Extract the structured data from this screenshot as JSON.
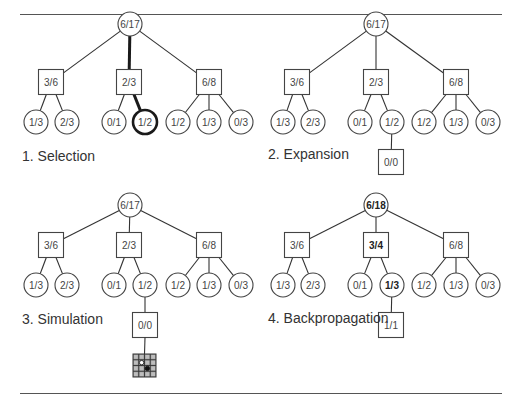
{
  "figure": {
    "colors": {
      "stroke": "#444444",
      "highlight": "#1a1a1a",
      "text": "#333333",
      "board_fill": "#999999",
      "board_grid": "#333333"
    },
    "panels": [
      {
        "id": "selection",
        "label": "1. Selection",
        "label_pos": [
          22,
          148
        ],
        "nodes": [
          {
            "id": "r",
            "shape": "circle",
            "x": 130,
            "y": 24,
            "text": "6/17"
          },
          {
            "id": "a",
            "shape": "square",
            "x": 51,
            "y": 82,
            "text": "3/6"
          },
          {
            "id": "b",
            "shape": "square",
            "x": 129,
            "y": 82,
            "text": "2/3"
          },
          {
            "id": "c",
            "shape": "square",
            "x": 209,
            "y": 82,
            "text": "6/8"
          },
          {
            "id": "a1",
            "shape": "circle",
            "x": 36,
            "y": 122,
            "text": "1/3"
          },
          {
            "id": "a2",
            "shape": "circle",
            "x": 67,
            "y": 122,
            "text": "2/3"
          },
          {
            "id": "b1",
            "shape": "circle",
            "x": 114,
            "y": 122,
            "text": "0/1"
          },
          {
            "id": "b2",
            "shape": "circle",
            "x": 145,
            "y": 122,
            "text": "1/2",
            "highlight": true
          },
          {
            "id": "c1",
            "shape": "circle",
            "x": 178,
            "y": 122,
            "text": "1/2"
          },
          {
            "id": "c2",
            "shape": "circle",
            "x": 209,
            "y": 122,
            "text": "1/3"
          },
          {
            "id": "c3",
            "shape": "circle",
            "x": 241,
            "y": 122,
            "text": "0/3"
          }
        ],
        "edges": [
          [
            "r",
            "a"
          ],
          [
            "r",
            "b",
            true
          ],
          [
            "r",
            "c"
          ],
          [
            "a",
            "a1"
          ],
          [
            "a",
            "a2"
          ],
          [
            "b",
            "b1"
          ],
          [
            "b",
            "b2",
            true
          ],
          [
            "c",
            "c1"
          ],
          [
            "c",
            "c2"
          ],
          [
            "c",
            "c3"
          ]
        ]
      },
      {
        "id": "expansion",
        "label": "2. Expansion",
        "label_pos": [
          268,
          146
        ],
        "nodes": [
          {
            "id": "r",
            "shape": "circle",
            "x": 376,
            "y": 24,
            "text": "6/17"
          },
          {
            "id": "a",
            "shape": "square",
            "x": 297,
            "y": 82,
            "text": "3/6"
          },
          {
            "id": "b",
            "shape": "square",
            "x": 376,
            "y": 82,
            "text": "2/3"
          },
          {
            "id": "c",
            "shape": "square",
            "x": 456,
            "y": 82,
            "text": "6/8"
          },
          {
            "id": "a1",
            "shape": "circle",
            "x": 283,
            "y": 122,
            "text": "1/3"
          },
          {
            "id": "a2",
            "shape": "circle",
            "x": 313,
            "y": 122,
            "text": "2/3"
          },
          {
            "id": "b1",
            "shape": "circle",
            "x": 360,
            "y": 122,
            "text": "0/1"
          },
          {
            "id": "b2",
            "shape": "circle",
            "x": 392,
            "y": 122,
            "text": "1/2"
          },
          {
            "id": "c1",
            "shape": "circle",
            "x": 424,
            "y": 122,
            "text": "1/2"
          },
          {
            "id": "c2",
            "shape": "circle",
            "x": 456,
            "y": 122,
            "text": "1/3"
          },
          {
            "id": "c3",
            "shape": "circle",
            "x": 488,
            "y": 122,
            "text": "0/3"
          },
          {
            "id": "n",
            "shape": "square",
            "x": 391,
            "y": 162,
            "text": "0/0"
          }
        ],
        "edges": [
          [
            "r",
            "a"
          ],
          [
            "r",
            "b"
          ],
          [
            "r",
            "c"
          ],
          [
            "a",
            "a1"
          ],
          [
            "a",
            "a2"
          ],
          [
            "b",
            "b1"
          ],
          [
            "b",
            "b2"
          ],
          [
            "c",
            "c1"
          ],
          [
            "c",
            "c2"
          ],
          [
            "c",
            "c3"
          ],
          [
            "b2",
            "n"
          ]
        ]
      },
      {
        "id": "simulation",
        "label": "3. Simulation",
        "label_pos": [
          22,
          311
        ],
        "nodes": [
          {
            "id": "r",
            "shape": "circle",
            "x": 130,
            "y": 205,
            "text": "6/17"
          },
          {
            "id": "a",
            "shape": "square",
            "x": 51,
            "y": 245,
            "text": "3/6"
          },
          {
            "id": "b",
            "shape": "square",
            "x": 129,
            "y": 245,
            "text": "2/3"
          },
          {
            "id": "c",
            "shape": "square",
            "x": 209,
            "y": 245,
            "text": "6/8"
          },
          {
            "id": "a1",
            "shape": "circle",
            "x": 36,
            "y": 285,
            "text": "1/3"
          },
          {
            "id": "a2",
            "shape": "circle",
            "x": 67,
            "y": 285,
            "text": "2/3"
          },
          {
            "id": "b1",
            "shape": "circle",
            "x": 114,
            "y": 285,
            "text": "0/1"
          },
          {
            "id": "b2",
            "shape": "circle",
            "x": 145,
            "y": 285,
            "text": "1/2"
          },
          {
            "id": "c1",
            "shape": "circle",
            "x": 178,
            "y": 285,
            "text": "1/2"
          },
          {
            "id": "c2",
            "shape": "circle",
            "x": 209,
            "y": 285,
            "text": "1/3"
          },
          {
            "id": "c3",
            "shape": "circle",
            "x": 241,
            "y": 285,
            "text": "0/3"
          },
          {
            "id": "n",
            "shape": "square",
            "x": 145,
            "y": 325,
            "text": "0/0"
          }
        ],
        "edges": [
          [
            "r",
            "a"
          ],
          [
            "r",
            "b"
          ],
          [
            "r",
            "c"
          ],
          [
            "a",
            "a1"
          ],
          [
            "a",
            "a2"
          ],
          [
            "b",
            "b1"
          ],
          [
            "b",
            "b2"
          ],
          [
            "c",
            "c1"
          ],
          [
            "c",
            "c2"
          ],
          [
            "c",
            "c3"
          ],
          [
            "b2",
            "n"
          ]
        ],
        "board": {
          "x": 133,
          "y": 354,
          "size": 23,
          "cells": 4,
          "parent": "n",
          "stones": [
            {
              "col": 1,
              "row": 1,
              "color": "white"
            },
            {
              "col": 2,
              "row": 2,
              "color": "black"
            }
          ]
        }
      },
      {
        "id": "backpropagation",
        "label": "4. Backpropagation",
        "label_pos": [
          268,
          310
        ],
        "nodes": [
          {
            "id": "r",
            "shape": "circle",
            "x": 376,
            "y": 205,
            "text": "6/18",
            "bold": true
          },
          {
            "id": "a",
            "shape": "square",
            "x": 297,
            "y": 245,
            "text": "3/6"
          },
          {
            "id": "b",
            "shape": "square",
            "x": 376,
            "y": 245,
            "text": "3/4",
            "bold": true
          },
          {
            "id": "c",
            "shape": "square",
            "x": 456,
            "y": 245,
            "text": "6/8"
          },
          {
            "id": "a1",
            "shape": "circle",
            "x": 283,
            "y": 285,
            "text": "1/3"
          },
          {
            "id": "a2",
            "shape": "circle",
            "x": 313,
            "y": 285,
            "text": "2/3"
          },
          {
            "id": "b1",
            "shape": "circle",
            "x": 360,
            "y": 285,
            "text": "0/1"
          },
          {
            "id": "b2",
            "shape": "circle",
            "x": 392,
            "y": 285,
            "text": "1/3",
            "bold": true
          },
          {
            "id": "c1",
            "shape": "circle",
            "x": 424,
            "y": 285,
            "text": "1/2"
          },
          {
            "id": "c2",
            "shape": "circle",
            "x": 456,
            "y": 285,
            "text": "1/3"
          },
          {
            "id": "c3",
            "shape": "circle",
            "x": 488,
            "y": 285,
            "text": "0/3"
          },
          {
            "id": "n",
            "shape": "square",
            "x": 391,
            "y": 325,
            "text": "1/1"
          }
        ],
        "edges": [
          [
            "r",
            "a"
          ],
          [
            "r",
            "b"
          ],
          [
            "r",
            "c"
          ],
          [
            "a",
            "a1"
          ],
          [
            "a",
            "a2"
          ],
          [
            "b",
            "b1"
          ],
          [
            "b",
            "b2"
          ],
          [
            "c",
            "c1"
          ],
          [
            "c",
            "c2"
          ],
          [
            "c",
            "c3"
          ],
          [
            "b2",
            "n"
          ]
        ]
      }
    ],
    "rules": [
      {
        "y": 14
      },
      {
        "y": 393
      }
    ]
  }
}
